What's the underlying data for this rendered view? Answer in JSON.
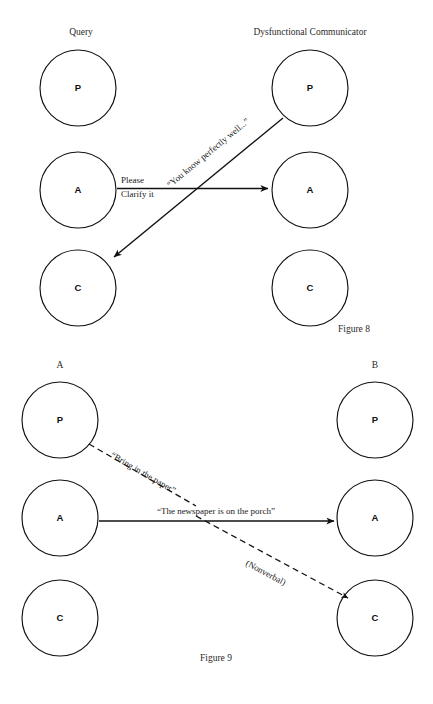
{
  "document": {
    "title": "Transactional Analysis Ego-State Diagrams",
    "background_color": "#ffffff",
    "ink_color": "#111111"
  },
  "figures": [
    {
      "id": "figure-8",
      "caption": "Figure 8",
      "caption_align": "right",
      "columns": [
        {
          "id": "left",
          "header": "Query"
        },
        {
          "id": "right",
          "header": "Dysfunctional Communicator"
        }
      ],
      "ego_states": [
        {
          "id": "left-parent",
          "letter": "P",
          "column": "left",
          "row": "parent"
        },
        {
          "id": "left-adult",
          "letter": "A",
          "column": "left",
          "row": "adult"
        },
        {
          "id": "left-child",
          "letter": "C",
          "column": "left",
          "row": "child"
        },
        {
          "id": "right-parent",
          "letter": "P",
          "column": "right",
          "row": "parent"
        },
        {
          "id": "right-adult",
          "letter": "A",
          "column": "right",
          "row": "adult"
        },
        {
          "id": "right-child",
          "letter": "C",
          "column": "right",
          "row": "child"
        }
      ],
      "transactions": [
        {
          "id": "stimulus",
          "style": "solid",
          "from": "left-adult",
          "to": "right-adult",
          "label_line_1": "Please",
          "label_line_2": "Clarify it"
        },
        {
          "id": "crossed-response",
          "style": "solid",
          "from": "right-parent",
          "to": "left-child",
          "label": "“You know perfectly well...”"
        }
      ]
    },
    {
      "id": "figure-9",
      "caption": "Figure 9",
      "caption_align": "center",
      "columns": [
        {
          "id": "left",
          "header": "A"
        },
        {
          "id": "right",
          "header": "B"
        }
      ],
      "ego_states": [
        {
          "id": "left-parent",
          "letter": "P",
          "column": "left",
          "row": "parent"
        },
        {
          "id": "left-adult",
          "letter": "A",
          "column": "left",
          "row": "adult"
        },
        {
          "id": "left-child",
          "letter": "C",
          "column": "left",
          "row": "child"
        },
        {
          "id": "right-parent",
          "letter": "P",
          "column": "right",
          "row": "parent"
        },
        {
          "id": "right-adult",
          "letter": "A",
          "column": "right",
          "row": "adult"
        },
        {
          "id": "right-child",
          "letter": "C",
          "column": "right",
          "row": "child"
        }
      ],
      "transactions": [
        {
          "id": "ulterior-parent",
          "style": "dashed",
          "from": "left-parent",
          "to": "crossing-point",
          "label": "“Bring in the paper”"
        },
        {
          "id": "social-adult",
          "style": "solid",
          "from": "left-adult",
          "to": "right-adult",
          "label": "“The newspaper is on the porch”"
        },
        {
          "id": "nonverbal-child",
          "style": "dashed",
          "from": "crossing-point",
          "to": "right-child",
          "label": "(Nonverbal)"
        }
      ]
    }
  ]
}
